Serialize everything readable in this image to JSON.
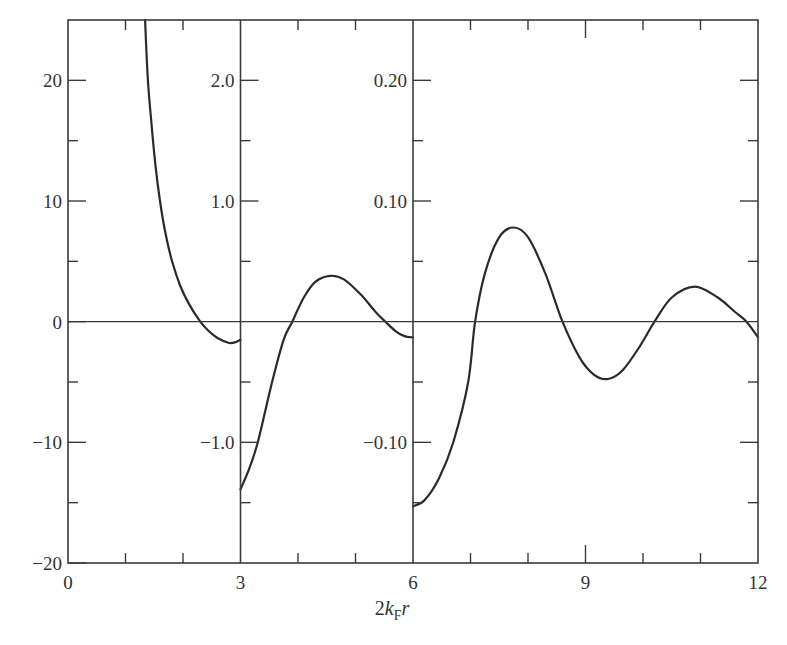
{
  "chart_data": {
    "type": "line",
    "title": "",
    "xlabel": "2k_F r",
    "xlabel_parts": {
      "prefix": "2",
      "k": "k",
      "sub": "F",
      "r": "r"
    },
    "ylabel": "",
    "xlim": [
      0,
      12
    ],
    "x_ticks": [
      0,
      3,
      6,
      9,
      12
    ],
    "x_tick_labels": [
      "0",
      "3",
      "6",
      "9",
      "12"
    ],
    "x_minor_ticks": [
      1,
      2,
      4,
      5,
      7,
      8,
      10,
      11
    ],
    "grid": false,
    "legend": null,
    "panels": [
      {
        "x_range": [
          0,
          3
        ],
        "ylim": [
          -20,
          25
        ],
        "y_ticks": [
          20,
          10,
          0,
          -10,
          -20
        ],
        "y_tick_labels": [
          "20",
          "10",
          "0",
          "−10",
          "−20"
        ],
        "y_minor_ticks": [
          15,
          5,
          -5,
          -15
        ],
        "series": {
          "name": "panel-1",
          "x": [
            1.34,
            1.39,
            1.45,
            1.52,
            1.6,
            1.7,
            1.81,
            1.95,
            2.1,
            2.3,
            2.45,
            2.6,
            2.79,
            2.9,
            3.0
          ],
          "y": [
            25,
            20,
            16.5,
            13,
            10,
            7.2,
            5,
            3.0,
            1.5,
            0.0,
            -0.8,
            -1.35,
            -1.75,
            -1.72,
            -1.5
          ]
        }
      },
      {
        "x_range": [
          3,
          6
        ],
        "ylim": [
          -2.0,
          2.5
        ],
        "y_ticks": [
          2.0,
          1.0,
          -1.0
        ],
        "y_tick_labels": [
          "2.0",
          "1.0",
          "−1.0"
        ],
        "y_minor_ticks": [
          1.5,
          0.5,
          -0.5,
          -1.5
        ],
        "series": {
          "name": "panel-2",
          "x": [
            3.0,
            3.15,
            3.3,
            3.55,
            3.75,
            3.9,
            4.1,
            4.3,
            4.56,
            4.8,
            5.1,
            5.35,
            5.52,
            5.7,
            5.85,
            6.0
          ],
          "y": [
            -1.39,
            -1.22,
            -1.0,
            -0.5,
            -0.15,
            0.0,
            0.2,
            0.33,
            0.38,
            0.35,
            0.22,
            0.08,
            0.0,
            -0.08,
            -0.12,
            -0.13
          ]
        }
      },
      {
        "x_range": [
          6,
          12
        ],
        "ylim": [
          -0.2,
          0.25
        ],
        "y_ticks": [
          0.2,
          0.1,
          -0.1
        ],
        "y_tick_labels": [
          "0.20",
          "0.10",
          "−0.10"
        ],
        "y_minor_ticks": [
          0.15,
          0.05,
          -0.05,
          -0.15
        ],
        "series": {
          "name": "panel-3",
          "x": [
            6.0,
            6.2,
            6.45,
            6.7,
            6.96,
            7.08,
            7.25,
            7.5,
            7.75,
            8.0,
            8.3,
            8.6,
            8.9,
            9.15,
            9.39,
            9.65,
            9.95,
            10.2,
            10.5,
            10.9,
            11.3,
            11.6,
            11.8,
            12.0
          ],
          "y": [
            -0.153,
            -0.148,
            -0.13,
            -0.1,
            -0.05,
            0.0,
            0.04,
            0.07,
            0.078,
            0.07,
            0.04,
            0.0,
            -0.03,
            -0.044,
            -0.0475,
            -0.04,
            -0.02,
            0.0,
            0.02,
            0.029,
            0.02,
            0.008,
            0.0,
            -0.013
          ]
        }
      }
    ]
  },
  "colors": {
    "axis": "#3a3a3a",
    "curve": "#2a2a2a",
    "text": "#333333",
    "background": "#ffffff"
  }
}
